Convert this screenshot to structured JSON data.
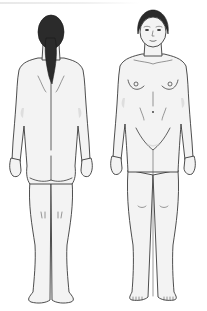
{
  "illustration": {
    "subject": "female body outline chart",
    "views": [
      {
        "id": "back",
        "label": "posterior view"
      },
      {
        "id": "front",
        "label": "anterior view"
      }
    ],
    "colors": {
      "background": "#ffffff",
      "skin": "#f3f3f3",
      "outline": "#3a3a3a",
      "hair": "#2b2b2b"
    }
  }
}
